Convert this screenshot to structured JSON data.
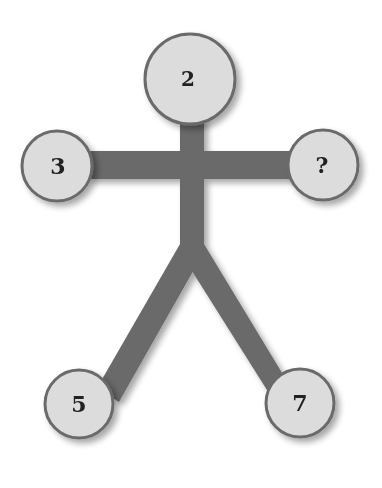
{
  "puzzle": {
    "type": "stick-figure number puzzle",
    "nodes": {
      "head": {
        "label": "2",
        "cx": 190,
        "cy": 79,
        "r": 45
      },
      "left_hand": {
        "label": "3",
        "cx": 57,
        "cy": 166,
        "r": 35
      },
      "right_hand": {
        "label": "?",
        "cx": 323,
        "cy": 165,
        "r": 35
      },
      "left_foot": {
        "label": "5",
        "cx": 79,
        "cy": 404,
        "r": 34
      },
      "right_foot": {
        "label": "7",
        "cx": 300,
        "cy": 403,
        "r": 34
      }
    }
  },
  "colors": {
    "limb": "#6b6b6b",
    "circle_fill": "#dcdcdc",
    "circle_stroke": "#6b6b6b",
    "text": "#222222"
  }
}
